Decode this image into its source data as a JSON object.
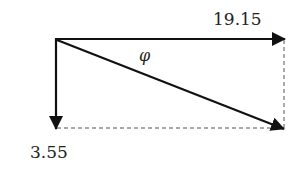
{
  "diagram": {
    "type": "vector-diagram",
    "colors": {
      "line": "#111111",
      "dash": "#555555",
      "text": "#222222",
      "background": "#ffffff"
    },
    "labels": {
      "horizontal_magnitude": "19.15",
      "vertical_magnitude": "3.55",
      "angle": "φ"
    },
    "vectors": [
      {
        "name": "horizontal-vector",
        "label": "19.15",
        "direction": "right"
      },
      {
        "name": "vertical-vector",
        "label": "3.55",
        "direction": "down"
      },
      {
        "name": "resultant-vector",
        "label": "",
        "direction": "diagonal-down-right"
      }
    ],
    "guides": [
      {
        "name": "vertical-dashed-guide"
      },
      {
        "name": "horizontal-dashed-guide"
      }
    ]
  }
}
